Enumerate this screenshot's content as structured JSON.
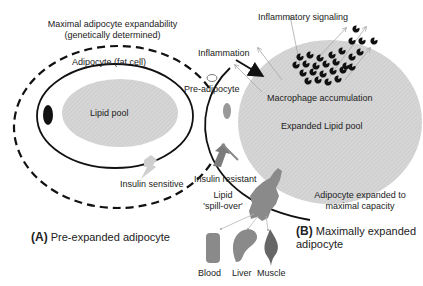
{
  "panel_a": {
    "top_label_line1": "Maximal adipocyte expandability",
    "top_label_line2": "(genetically determined)",
    "cell_label": "Adipocyte (fat cell)",
    "lipid_label": "Lipid pool",
    "insulin_label": "Insulin sensitive",
    "caption_letter": "(A)",
    "caption_text": "Pre-expanded adipocyte"
  },
  "panel_b": {
    "inflammatory_label": "Inflammatory signaling",
    "inflammation_label": "Inflammation",
    "preadipocyte_label": "Pre-adipocyte",
    "macrophage_label": "Macrophage accumulation",
    "lipid_label": "Expanded Lipid pool",
    "insulin_label": "Insulin resistant",
    "spill_line1": "Lipid",
    "spill_line2": "'spill-over'",
    "capacity_line1": "Adipocyte expanded to",
    "capacity_line2": "maximal capacity",
    "caption_letter": "(B)",
    "caption_line1": "Maximally expanded",
    "caption_line2": "adipocyte",
    "targets": [
      "Blood",
      "Liver",
      "Muscle"
    ]
  },
  "colors": {
    "lipid_fill": "#d4d4d4",
    "organ_fill": "#8a8a8a",
    "muscle_fill": "#6a6a6a",
    "insulin_sensitive_arrow": "#c8c8c8",
    "insulin_resistant_arrow": "#7a7a7a",
    "macrophage": "#111111"
  }
}
